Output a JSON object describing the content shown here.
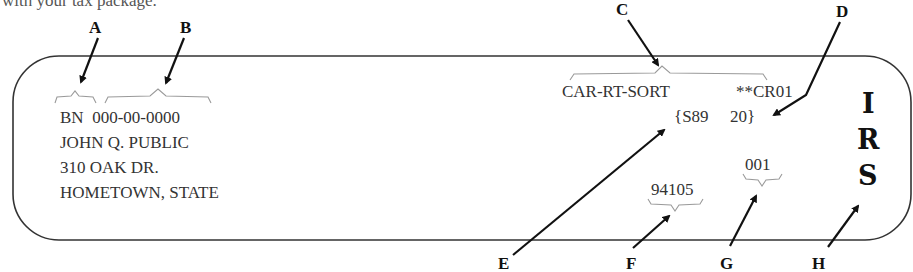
{
  "intro_text": "with your tax package.",
  "callouts": {
    "A": "A",
    "B": "B",
    "C": "C",
    "D": "D",
    "E": "E",
    "F": "F",
    "G": "G",
    "H": "H"
  },
  "label": {
    "name_control": "BN",
    "ssn": "000-00-0000",
    "name": "JOHN Q. PUBLIC",
    "street": "310 OAK DR.",
    "city_state": "HOMETOWN, STATE",
    "presort": "CAR-RT-SORT",
    "carrier_route": "**CR01",
    "code_left": "{S89",
    "code_right": "20}",
    "zip": "94105",
    "sequence": "001",
    "irs_letters": [
      "I",
      "R",
      "S"
    ]
  },
  "colors": {
    "border": "#333333",
    "arrow": "#111111",
    "brace": "#9a9a9a",
    "text": "#333333"
  }
}
